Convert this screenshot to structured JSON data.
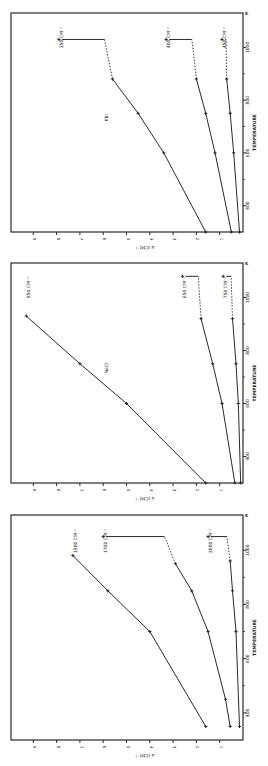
{
  "figure": {
    "orientation": "rotated 90 degrees clockwise (temperature axis runs vertically on the right edge, alpha axis horizontally along the bottom)",
    "ink_color": "#2a2a2a",
    "background": "#ffffff"
  },
  "chart_data": [
    {
      "type": "line",
      "panel": "top",
      "title": "",
      "annotation": "KBr",
      "xlabel": "TEMPERATURE",
      "x_unit": "K",
      "ylabel": "α (CM)⁻¹",
      "xlim": [
        300,
        1100
      ],
      "ylim": [
        0,
        9.5
      ],
      "xticks": [
        400,
        600,
        800,
        1000
      ],
      "yticks": [
        1,
        2,
        3,
        4,
        5,
        6,
        7,
        8,
        9
      ],
      "grid": false,
      "series": [
        {
          "name": "350 CM⁻¹",
          "x": [
            300,
            600,
            750,
            880,
            1030
          ],
          "y": [
            1.6,
            3.4,
            4.5,
            5.6,
            7.9
          ],
          "dashed_from_index": 3,
          "note": "last point connected by dashed then solid horizontal"
        },
        {
          "name": "400 CM⁻¹",
          "x": [
            300,
            600,
            750,
            880,
            1030
          ],
          "y": [
            0.5,
            1.2,
            1.6,
            2.0,
            3.3
          ],
          "dashed_from_index": 3
        },
        {
          "name": "450 CM⁻¹",
          "x": [
            300,
            600,
            750,
            880,
            1030
          ],
          "y": [
            0.15,
            0.4,
            0.55,
            0.7,
            0.9
          ],
          "dashed_from_index": 3
        }
      ]
    },
    {
      "type": "line",
      "panel": "middle",
      "title": "",
      "annotation": "NaCl",
      "xlabel": "TEMPERATURE",
      "x_unit": "K",
      "ylabel": "α (CM)⁻¹",
      "xlim": [
        300,
        1100
      ],
      "ylim": [
        0,
        9.5
      ],
      "xticks": [
        400,
        600,
        800,
        1000
      ],
      "yticks": [
        1,
        2,
        3,
        4,
        5,
        6,
        7,
        8,
        9
      ],
      "grid": false,
      "series": [
        {
          "name": "550 CM⁻¹",
          "x": [
            300,
            600,
            750,
            930
          ],
          "y": [
            1.6,
            5.0,
            7.0,
            9.3
          ],
          "dashed_from_index": null
        },
        {
          "name": "650 CM⁻¹",
          "x": [
            300,
            600,
            750,
            920,
            1080
          ],
          "y": [
            0.35,
            0.9,
            1.3,
            1.8,
            2.6
          ],
          "dashed_from_index": 3
        },
        {
          "name": "750 CM⁻¹",
          "x": [
            300,
            600,
            750,
            920,
            1080
          ],
          "y": [
            0.1,
            0.2,
            0.3,
            0.45,
            0.85
          ],
          "dashed_from_index": 3
        }
      ]
    },
    {
      "type": "line",
      "panel": "bottom",
      "title": "",
      "annotation": "",
      "xlabel": "TEMPERATURE",
      "x_unit": "K",
      "ylabel": "α (CM)⁻¹",
      "xlim": [
        300,
        1100
      ],
      "ylim": [
        0,
        9.5
      ],
      "xticks": [
        400,
        600,
        800,
        1000
      ],
      "yticks": [
        1,
        2,
        3,
        4,
        5,
        6,
        7,
        8,
        9
      ],
      "grid": false,
      "series": [
        {
          "name": "1500 CM⁻¹",
          "x": [
            350,
            700,
            850,
            980
          ],
          "y": [
            1.6,
            4.0,
            5.8,
            7.3
          ],
          "dashed_from_index": null
        },
        {
          "name": "1700 CM⁻¹",
          "x": [
            350,
            450,
            700,
            850,
            950,
            1050
          ],
          "y": [
            0.55,
            0.75,
            1.5,
            2.2,
            2.9,
            6.0
          ],
          "dashed_from_index": 4
        },
        {
          "name": "2000 CM⁻¹",
          "x": [
            350,
            700,
            850,
            960,
            1050
          ],
          "y": [
            0.15,
            0.3,
            0.45,
            0.55,
            1.5
          ],
          "dashed_from_index": 3
        }
      ]
    }
  ],
  "labels": {
    "ylabel": "α (CM)⁻¹",
    "xlabel": "TEMPERATURE",
    "x_unit_mark": "K",
    "panels": [
      {
        "material": "KBr",
        "series_labels": [
          "350 CM⁻¹",
          "400 CM⁻¹",
          "450 CM⁻¹"
        ],
        "xtick_labels": [
          "400",
          "600",
          "800",
          "1000"
        ]
      },
      {
        "material": "NaCl",
        "series_labels": [
          "550 CM⁻¹",
          "650 CM⁻¹",
          "750 CM⁻¹"
        ],
        "xtick_labels": [
          "400",
          "600",
          "800",
          "1000"
        ]
      },
      {
        "material": "",
        "series_labels": [
          "1500 CM⁻¹",
          "1700 CM⁻¹",
          "2000 CM⁻¹"
        ],
        "xtick_labels": [
          "400",
          "600",
          "800",
          "1000"
        ]
      }
    ],
    "ytick_labels": [
      "1",
      "2",
      "3",
      "4",
      "5",
      "6",
      "7",
      "8",
      "9"
    ]
  }
}
